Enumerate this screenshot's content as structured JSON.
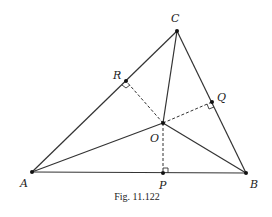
{
  "figure": {
    "caption": "Fig. 11.122",
    "stroke_color": "#333333",
    "points": {
      "A": {
        "label": "A",
        "x": 32,
        "y": 172
      },
      "B": {
        "label": "B",
        "x": 246,
        "y": 173
      },
      "C": {
        "label": "C",
        "x": 177,
        "y": 31
      },
      "O": {
        "label": "O",
        "x": 163,
        "y": 123
      },
      "P": {
        "label": "P",
        "x": 163,
        "y": 173
      },
      "Q": {
        "label": "Q",
        "x": 212,
        "y": 102
      },
      "R": {
        "label": "R",
        "x": 126,
        "y": 81
      }
    },
    "solid_segments": [
      "AB",
      "BC",
      "CA",
      "OA",
      "OB",
      "OC"
    ],
    "dashed_segments": [
      "OP",
      "OQ",
      "OR"
    ],
    "right_angles": [
      "P",
      "Q",
      "R"
    ]
  }
}
